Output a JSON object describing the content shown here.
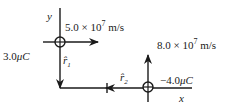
{
  "diagram": {
    "axes": {
      "x_label": "x",
      "y_label": "y"
    },
    "charge1": {
      "charge_label": "3.0",
      "charge_unit": "μC",
      "velocity_mantissa": "5.0 × 10",
      "velocity_exponent": "7",
      "velocity_unit": " m/s",
      "velocity_direction": "+x",
      "unit_vector_label": "r̂",
      "unit_vector_sub": "1"
    },
    "charge2": {
      "charge_label": "−4.0",
      "charge_unit": "μC",
      "velocity_mantissa": "8.0 × 10",
      "velocity_exponent": "7",
      "velocity_unit": " m/s",
      "velocity_direction": "+y",
      "unit_vector_label": "r̂",
      "unit_vector_sub": "2"
    },
    "colors": {
      "ink": "#1a1a1a",
      "background": "#ffffff"
    }
  }
}
